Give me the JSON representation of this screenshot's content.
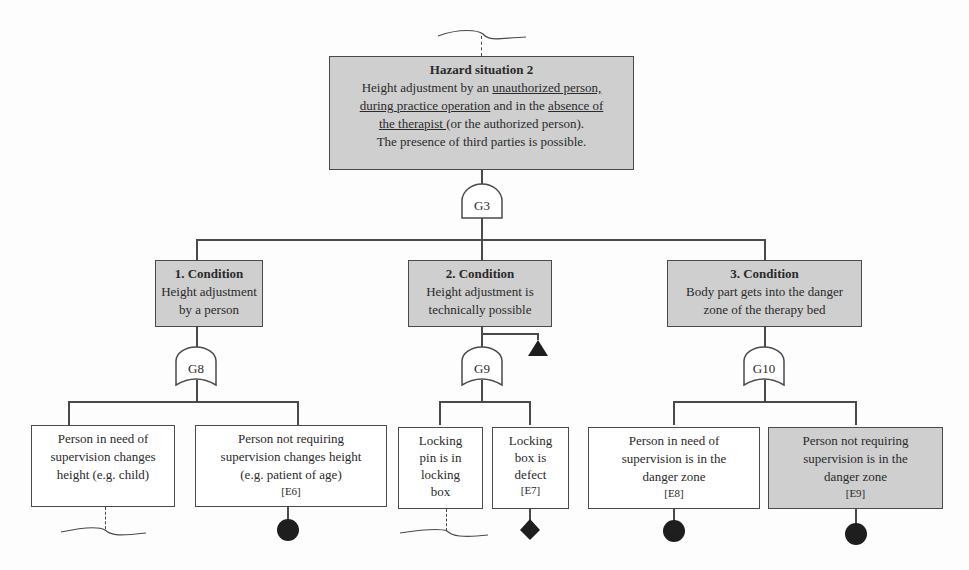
{
  "top_event": {
    "title": "Hazard situation 2",
    "line1_pre": "Height adjustment by an ",
    "line1_u": "unauthorized person,",
    "line2_u": "during practice operation",
    "line2_mid": " and in the ",
    "line2_u2": "absence of",
    "line3_u": "the therapist ",
    "line3_post": "(or the authorized person).",
    "line4": "The presence of third parties is possible."
  },
  "gates": {
    "g3": {
      "label": "G3",
      "type": "AND"
    },
    "g8": {
      "label": "G8",
      "type": "OR"
    },
    "g9": {
      "label": "G9",
      "type": "OR"
    },
    "g10": {
      "label": "G10",
      "type": "OR"
    }
  },
  "conditions": [
    {
      "title": "1. Condition",
      "line1": "Height adjustment",
      "line2": "by a person"
    },
    {
      "title": "2. Condition",
      "line1": "Height adjustment is",
      "line2": "technically possible"
    },
    {
      "title": "3. Condition",
      "line1": "Body part gets into the danger",
      "line2": "zone of the therapy bed"
    }
  ],
  "events": [
    {
      "lines": [
        "Person in need of",
        "supervision changes",
        "height (e.g. child)"
      ],
      "id": "",
      "symbol": "undeveloped-dashed",
      "shaded": false
    },
    {
      "lines": [
        "Person not requiring",
        "supervision changes height",
        "(e.g. patient of age)"
      ],
      "id": "[E6]",
      "symbol": "basic-event-circle",
      "shaded": false
    },
    {
      "lines": [
        "Locking",
        "pin is in",
        "locking",
        "box"
      ],
      "id": "",
      "symbol": "undeveloped-dashed",
      "shaded": false
    },
    {
      "lines": [
        "Locking",
        "box is",
        "defect"
      ],
      "id": "[E7]",
      "symbol": "diamond",
      "shaded": false
    },
    {
      "lines": [
        "Person in need of",
        "supervision is in the",
        "danger zone"
      ],
      "id": "[E8]",
      "symbol": "basic-event-circle",
      "shaded": false
    },
    {
      "lines": [
        "Person not requiring",
        "supervision is in the",
        "danger zone"
      ],
      "id": "[E9]",
      "symbol": "basic-event-circle",
      "shaded": true
    }
  ],
  "transfer_symbol": "transfer-triangle",
  "colors": {
    "shaded_box": "#cfcfcf",
    "line": "#4a4a4a",
    "symbol_fill": "#1e1e1e"
  }
}
